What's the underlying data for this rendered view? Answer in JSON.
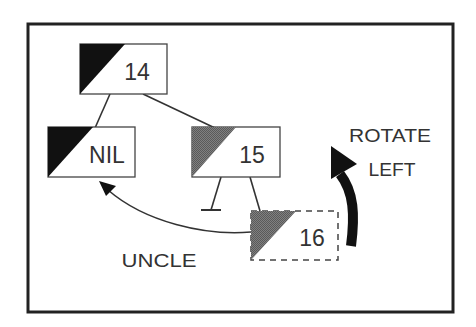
{
  "diagram": {
    "type": "red-black-tree-rotation",
    "colors": {
      "background": "#ffffff",
      "frame": "#222222",
      "black_node": "#111111",
      "red_node": "#707070",
      "text": "#333333",
      "edge": "#333333"
    },
    "nodes": [
      {
        "id": "n14",
        "label": "14",
        "color": "black",
        "border": "solid"
      },
      {
        "id": "nnil",
        "label": "NIL",
        "color": "black",
        "border": "solid"
      },
      {
        "id": "n15",
        "label": "15",
        "color": "red",
        "border": "solid"
      },
      {
        "id": "n16",
        "label": "16",
        "color": "red",
        "border": "dashed"
      }
    ],
    "edges": [
      {
        "from": "14",
        "to": "NIL"
      },
      {
        "from": "14",
        "to": "15"
      },
      {
        "from": "15",
        "to": "nil-leaf"
      },
      {
        "from": "15",
        "to": "16"
      }
    ],
    "annotations": {
      "uncle_label": "UNCLE",
      "rotate_line1": "ROTATE",
      "rotate_line2": "LEFT"
    }
  }
}
